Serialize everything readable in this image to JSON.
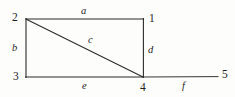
{
  "figure": {
    "type": "graph-diagram",
    "stroke_color": "#2b2b2b",
    "background_color": "#fdfdfc",
    "text_color": "#1d1d1d"
  },
  "vertices": [
    {
      "id": "v1",
      "label": "1",
      "x": 143,
      "y": 19,
      "label_x": 149,
      "label_y": 13
    },
    {
      "id": "v2",
      "label": "2",
      "x": 26,
      "y": 19,
      "label_x": 12,
      "label_y": 12
    },
    {
      "id": "v3",
      "label": "3",
      "x": 26,
      "y": 77,
      "label_x": 13,
      "label_y": 71
    },
    {
      "id": "v4",
      "label": "4",
      "x": 143,
      "y": 77,
      "label_x": 140,
      "label_y": 82
    },
    {
      "id": "v5",
      "label": "5",
      "x": 218,
      "y": 77,
      "label_x": 222,
      "label_y": 69
    }
  ],
  "edges": [
    {
      "id": "a",
      "label": "a",
      "from": "v2",
      "to": "v1",
      "label_x": 81,
      "label_y": 6
    },
    {
      "id": "b",
      "label": "b",
      "from": "v2",
      "to": "v3",
      "label_x": 12,
      "label_y": 43
    },
    {
      "id": "c",
      "label": "c",
      "from": "v2",
      "to": "v4",
      "label_x": 88,
      "label_y": 35
    },
    {
      "id": "d",
      "label": "d",
      "from": "v1",
      "to": "v4",
      "label_x": 148,
      "label_y": 45
    },
    {
      "id": "e",
      "label": "e",
      "from": "v3",
      "to": "v4",
      "label_x": 82,
      "label_y": 81
    },
    {
      "id": "f",
      "label": "f",
      "from": "v4",
      "to": "v5",
      "label_x": 182,
      "label_y": 81
    }
  ]
}
